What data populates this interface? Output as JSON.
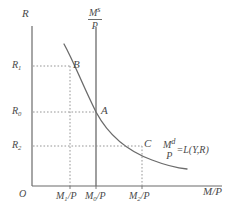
{
  "figure": {
    "name": "money-market-equilibrium-diagram",
    "background_color": "#ffffff",
    "line_color": "#6b6b6b",
    "text_color": "#4a4a4a",
    "dotted_color": "#8a8a8a"
  },
  "axes": {
    "y_axis_label": "R",
    "x_axis_label": "M/P",
    "origin_label": "O"
  },
  "y_ticks": [
    {
      "label": "R",
      "sub": "1",
      "y": 67
    },
    {
      "label": "R",
      "sub": "0",
      "y": 113
    },
    {
      "label": "R",
      "sub": "2",
      "y": 147
    }
  ],
  "x_ticks": [
    {
      "label": "M",
      "sub": "1",
      "suffix": "/P",
      "x": 66
    },
    {
      "label": "M",
      "sub": "0",
      "suffix": "/P",
      "x": 95
    },
    {
      "label": "M",
      "sub": "2",
      "suffix": "/P",
      "x": 139
    }
  ],
  "supply_curve": {
    "numerator": "M",
    "numerator_sup": "s",
    "denominator": "P"
  },
  "demand_curve": {
    "numerator": "M",
    "numerator_sup": "d",
    "denominator": "P",
    "equation_tail": "=L(Y,R)"
  },
  "points": [
    {
      "label": "B",
      "x": 70,
      "y": 66
    },
    {
      "label": "A",
      "x": 99,
      "y": 112
    },
    {
      "label": "C",
      "x": 142,
      "y": 146
    }
  ]
}
